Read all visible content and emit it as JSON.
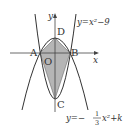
{
  "diagram": {
    "type": "parabola-intersection",
    "points": {
      "A": "A",
      "B": "B",
      "C": "C",
      "D": "D",
      "O": "O"
    },
    "axes": {
      "x_label": "x",
      "y_label": "y"
    },
    "curves": {
      "upper_label": "y=x²−9",
      "lower_label_prefix": "y=−",
      "lower_frac_num": "1",
      "lower_frac_den": "3",
      "lower_label_suffix": "x²+k"
    },
    "shaded_region": "quadrilateral ADBC",
    "colors": {
      "fill": "#b3b3b3",
      "stroke": "#333333"
    }
  }
}
